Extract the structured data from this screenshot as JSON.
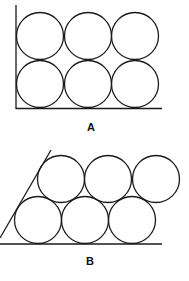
{
  "figure": {
    "panels": [
      {
        "label": "A",
        "arrangement": "square packing",
        "rows": 2,
        "cols": 3,
        "label_pos": {
          "x": 91,
          "y": 121
        },
        "circle_radius": 23.5,
        "circles": [
          {
            "cx": 40,
            "cy": 36
          },
          {
            "cx": 88,
            "cy": 36
          },
          {
            "cx": 135,
            "cy": 36
          },
          {
            "cx": 40,
            "cy": 84
          },
          {
            "cx": 88,
            "cy": 84
          },
          {
            "cx": 135,
            "cy": 84
          }
        ],
        "lines": [
          {
            "x1": 16,
            "y1": 5,
            "x2": 16,
            "y2": 109
          },
          {
            "x1": 16,
            "y1": 108.5,
            "x2": 162,
            "y2": 108.5
          }
        ]
      },
      {
        "label": "B",
        "arrangement": "hexagonal (offset) packing",
        "rows": 2,
        "cols": 3,
        "label_pos": {
          "x": 90,
          "y": 255
        },
        "circle_radius": 23.5,
        "circles": [
          {
            "cx": 61,
            "cy": 179
          },
          {
            "cx": 108,
            "cy": 179
          },
          {
            "cx": 156,
            "cy": 179
          },
          {
            "cx": 38,
            "cy": 220
          },
          {
            "cx": 85,
            "cy": 220
          },
          {
            "cx": 132,
            "cy": 220
          }
        ],
        "lines": [
          {
            "x1": 0,
            "y1": 238,
            "x2": 51,
            "y2": 150
          },
          {
            "x1": 0,
            "y1": 244,
            "x2": 162,
            "y2": 244
          }
        ]
      }
    ],
    "stroke_color": "#1a1a1a"
  }
}
